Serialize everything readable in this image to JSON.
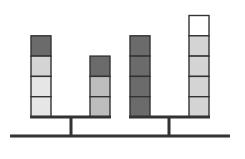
{
  "colors": {
    "line": "#333333",
    "block_border": "#333333",
    "dark": "#6b6b6b",
    "medium": "#bdbdbd",
    "light": "#d4d4d4",
    "lighter": "#e6e6e6",
    "white": "#ffffff"
  },
  "balances": [
    {
      "name": "left-balance",
      "stacks": [
        {
          "side": "left",
          "blocks": [
            "dark",
            "light",
            "lighter",
            "lighter"
          ]
        },
        {
          "side": "right",
          "blocks": [
            "dark",
            "medium",
            "medium"
          ]
        }
      ]
    },
    {
      "name": "right-balance",
      "stacks": [
        {
          "side": "left",
          "blocks": [
            "dark",
            "dark",
            "dark",
            "dark"
          ]
        },
        {
          "side": "right",
          "blocks": [
            "white",
            "light",
            "light",
            "light",
            "light"
          ]
        }
      ]
    }
  ]
}
